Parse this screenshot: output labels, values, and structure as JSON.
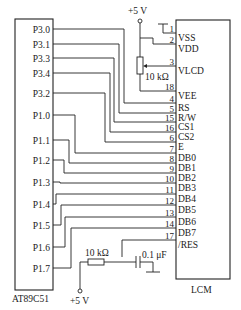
{
  "diagram": {
    "type": "circuit-schematic",
    "mcu": {
      "name": "AT89C51",
      "pins": [
        {
          "label": "P3.0",
          "y": 29,
          "route_x": 124,
          "to_lcm_pin": "4"
        },
        {
          "label": "P3.1",
          "y": 44,
          "route_x": 119,
          "to_lcm_pin": "5"
        },
        {
          "label": "P3.3",
          "y": 58,
          "route_x": 114,
          "to_lcm_pin": "15"
        },
        {
          "label": "P3.4",
          "y": 73,
          "route_x": 110,
          "to_lcm_pin": "16"
        },
        {
          "label": "P3.2",
          "y": 93,
          "route_x": 105,
          "to_lcm_pin": "6"
        },
        {
          "label": "P1.0",
          "y": 115,
          "route_x": 75,
          "to_lcm_pin": "7"
        },
        {
          "label": "P1.1",
          "y": 140,
          "route_x": 69,
          "to_lcm_pin": "8"
        },
        {
          "label": "P1.2",
          "y": 160,
          "route_x": 64,
          "to_lcm_pin": "9"
        },
        {
          "label": "P1.3",
          "y": 182,
          "route_x": 60,
          "to_lcm_pin": "10"
        },
        {
          "label": "P1.4",
          "y": 204,
          "route_x": 56,
          "to_lcm_pin": "11"
        },
        {
          "label": "P1.5",
          "y": 225,
          "route_x": 61,
          "to_lcm_pin": "12"
        },
        {
          "label": "P1.6",
          "y": 247,
          "route_x": 65,
          "to_lcm_pin": "13"
        },
        {
          "label": "P1.7",
          "y": 268,
          "route_x": 71,
          "to_lcm_pin": "14"
        }
      ]
    },
    "lcm": {
      "name": "LCM",
      "pins": [
        {
          "num": "1",
          "label": "VSS",
          "y": 33
        },
        {
          "num": "2",
          "label": "VDD",
          "y": 44
        },
        {
          "num": "3",
          "label": "VLCD",
          "y": 66
        },
        {
          "num": "18",
          "label": "VEE",
          "y": 91
        },
        {
          "num": "4",
          "label": "RS",
          "y": 103
        },
        {
          "num": "5",
          "label": "R/W",
          "y": 113
        },
        {
          "num": "15",
          "label": "CS1",
          "y": 122
        },
        {
          "num": "16",
          "label": "CS2",
          "y": 132
        },
        {
          "num": "6",
          "label": "E",
          "y": 142
        },
        {
          "num": "7",
          "label": "DB0",
          "y": 153
        },
        {
          "num": "8",
          "label": "DB1",
          "y": 163
        },
        {
          "num": "9",
          "label": "DB2",
          "y": 173
        },
        {
          "num": "10",
          "label": "DB3",
          "y": 183
        },
        {
          "num": "11",
          "label": "DB4",
          "y": 194
        },
        {
          "num": "12",
          "label": "DB5",
          "y": 205
        },
        {
          "num": "13",
          "label": "DB6",
          "y": 217
        },
        {
          "num": "14",
          "label": "DB7",
          "y": 228
        },
        {
          "num": "17",
          "label": "/RES",
          "y": 240
        }
      ]
    },
    "power_top": {
      "label": "+5 V"
    },
    "potentiometer": {
      "label": "10 kΩ"
    },
    "reset_resistor": {
      "label": "10 kΩ"
    },
    "reset_capacitor": {
      "label": "0.1 μF"
    },
    "power_bottom": {
      "label": "+5 V"
    }
  }
}
